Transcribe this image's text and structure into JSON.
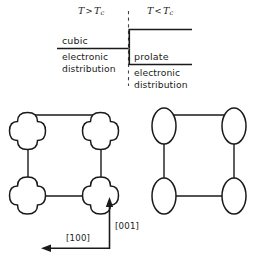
{
  "figure": {
    "stroke_color": "#1a1a1a",
    "text_color": "#1a1a1a",
    "background_color": "#ffffff"
  },
  "conditions": {
    "left": {
      "symbol": "T",
      "operator": ">",
      "reference": "T",
      "reference_sub": "c",
      "text": "T > Tc"
    },
    "right": {
      "symbol": "T",
      "operator": "<",
      "reference": "T",
      "reference_sub": "c",
      "text": "T < Tc"
    }
  },
  "phases": {
    "left": {
      "name": "cubic",
      "descriptor_line1": "electronic",
      "descriptor_line2": "distribution"
    },
    "right": {
      "name": "prolate",
      "descriptor_line1": "electronic",
      "descriptor_line2": "distribution"
    }
  },
  "axes": {
    "horizontal": {
      "label": "[100]",
      "direction": "left"
    },
    "vertical": {
      "label": "[001]",
      "direction": "up"
    }
  },
  "lattices": {
    "left": {
      "node_shape": "cloverleaf-cubic",
      "node_count": 4,
      "nodes": [
        {
          "cx": 28,
          "cy": 132
        },
        {
          "cx": 101,
          "cy": 132
        },
        {
          "cx": 28,
          "cy": 196
        },
        {
          "cx": 101,
          "cy": 196
        }
      ]
    },
    "right": {
      "node_shape": "prolate-ellipse",
      "node_count": 4,
      "nodes": [
        {
          "cx": 164,
          "cy": 132
        },
        {
          "cx": 234,
          "cy": 132
        },
        {
          "cx": 164,
          "cy": 196
        },
        {
          "cx": 234,
          "cy": 196
        }
      ]
    }
  },
  "divider": {
    "style": "dashed",
    "x": 128,
    "y_top": 11,
    "y_bottom": 86
  }
}
